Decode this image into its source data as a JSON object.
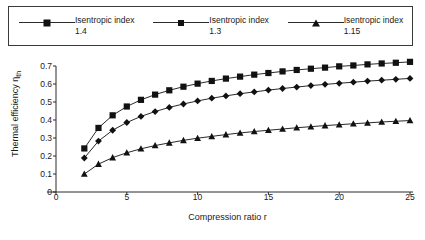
{
  "legend": {
    "entries": [
      {
        "label_line1": "Isentropic index",
        "label_line2": "1.4",
        "marker": "square-marker-icon"
      },
      {
        "label_line1": "Isentropic index",
        "label_line2": "1.3",
        "marker": "diamond-marker-icon"
      },
      {
        "label_line1": "Isentropic index",
        "label_line2": "1.15",
        "marker": "triangle-marker-icon"
      }
    ]
  },
  "chart_data": {
    "type": "line",
    "title": "",
    "xlabel": "Compression ratio r",
    "ylabel": "Thermal efficiency η",
    "ylabel_sub": "th",
    "xlim": [
      0,
      25
    ],
    "ylim": [
      0,
      0.7
    ],
    "grid": false,
    "legend_position": "top",
    "xticks": [
      0,
      5,
      10,
      15,
      20,
      25
    ],
    "xtick_labels": [
      "0",
      "5",
      "10",
      "15",
      "20",
      "25"
    ],
    "yticks": [
      0,
      0.1,
      0.2,
      0.3,
      0.4,
      0.5,
      0.6,
      0.7
    ],
    "ytick_labels": [
      "0",
      "0.1",
      "0.2",
      "0.3",
      "0.4",
      "0.5",
      "0.6",
      "0.7"
    ],
    "x": [
      2,
      3,
      4,
      5,
      6,
      7,
      8,
      9,
      10,
      11,
      12,
      13,
      14,
      15,
      16,
      17,
      18,
      19,
      20,
      21,
      22,
      23,
      24,
      25
    ],
    "series": [
      {
        "name": "Isentropic index 1.4",
        "marker": "square",
        "color": "#111111",
        "values": [
          0.242,
          0.356,
          0.426,
          0.475,
          0.512,
          0.541,
          0.565,
          0.585,
          0.602,
          0.617,
          0.63,
          0.641,
          0.652,
          0.661,
          0.67,
          0.678,
          0.685,
          0.691,
          0.698,
          0.703,
          0.709,
          0.714,
          0.718,
          0.723
        ]
      },
      {
        "name": "Isentropic index 1.3",
        "marker": "diamond",
        "color": "#111111",
        "values": [
          0.189,
          0.283,
          0.343,
          0.386,
          0.42,
          0.447,
          0.47,
          0.489,
          0.506,
          0.521,
          0.534,
          0.546,
          0.556,
          0.566,
          0.575,
          0.583,
          0.591,
          0.598,
          0.604,
          0.61,
          0.616,
          0.621,
          0.626,
          0.631
        ]
      },
      {
        "name": "Isentropic index 1.15",
        "marker": "triangle",
        "color": "#111111",
        "values": [
          0.1,
          0.155,
          0.191,
          0.218,
          0.24,
          0.258,
          0.273,
          0.287,
          0.299,
          0.309,
          0.319,
          0.328,
          0.336,
          0.343,
          0.35,
          0.357,
          0.363,
          0.369,
          0.374,
          0.379,
          0.384,
          0.389,
          0.393,
          0.397
        ]
      }
    ]
  }
}
